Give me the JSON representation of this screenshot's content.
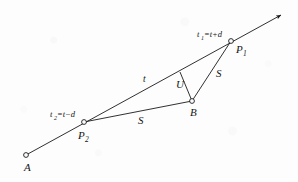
{
  "figure": {
    "background_color": "#fdfdfd",
    "ink_color": "#1a1a1a",
    "points": [
      {
        "id": "A",
        "label": "A",
        "x": 26,
        "y": 155,
        "marker": "open-circle",
        "label_x": 24,
        "label_y": 171
      },
      {
        "id": "P2",
        "label": "P",
        "sub": "2",
        "x": 84,
        "y": 122,
        "marker": "open-circle",
        "label_x": 78,
        "label_y": 139
      },
      {
        "id": "P1",
        "label": "P",
        "sub": "1",
        "x": 231,
        "y": 41,
        "marker": "open-circle",
        "label_x": 236,
        "label_y": 53
      },
      {
        "id": "B",
        "label": "B",
        "x": 192,
        "y": 101,
        "marker": "open-circle",
        "label_x": 191,
        "label_y": 116
      },
      {
        "id": "F",
        "label": "",
        "x": 180,
        "y": 72,
        "marker": "none",
        "label_x": 0,
        "label_y": 0
      }
    ],
    "ray": {
      "name": "main-ray",
      "from_x": 26,
      "from_y": 155,
      "to_x": 283,
      "to_y": 14,
      "arrow": true
    },
    "segments": [
      {
        "id": "seg-P2-B",
        "from": "P2",
        "to": "B",
        "label": "S",
        "label_x": 138,
        "label_y": 124
      },
      {
        "id": "seg-B-P1",
        "from": "B",
        "to": "P1",
        "label": "S",
        "label_x": 216,
        "label_y": 77
      },
      {
        "id": "seg-F-B",
        "from": "F",
        "to": "B",
        "label": "U",
        "label_x": 176,
        "label_y": 88
      }
    ],
    "labels": [
      {
        "id": "label-t1",
        "text": "t",
        "sub": "1",
        "rest": "=t+d",
        "x": 197,
        "y": 37
      },
      {
        "id": "label-t2",
        "text": "t",
        "sub": "2",
        "rest": "=t−d",
        "x": 50,
        "y": 117
      },
      {
        "id": "label-t",
        "text": "t",
        "sub": "",
        "rest": "",
        "x": 143,
        "y": 82
      }
    ]
  }
}
